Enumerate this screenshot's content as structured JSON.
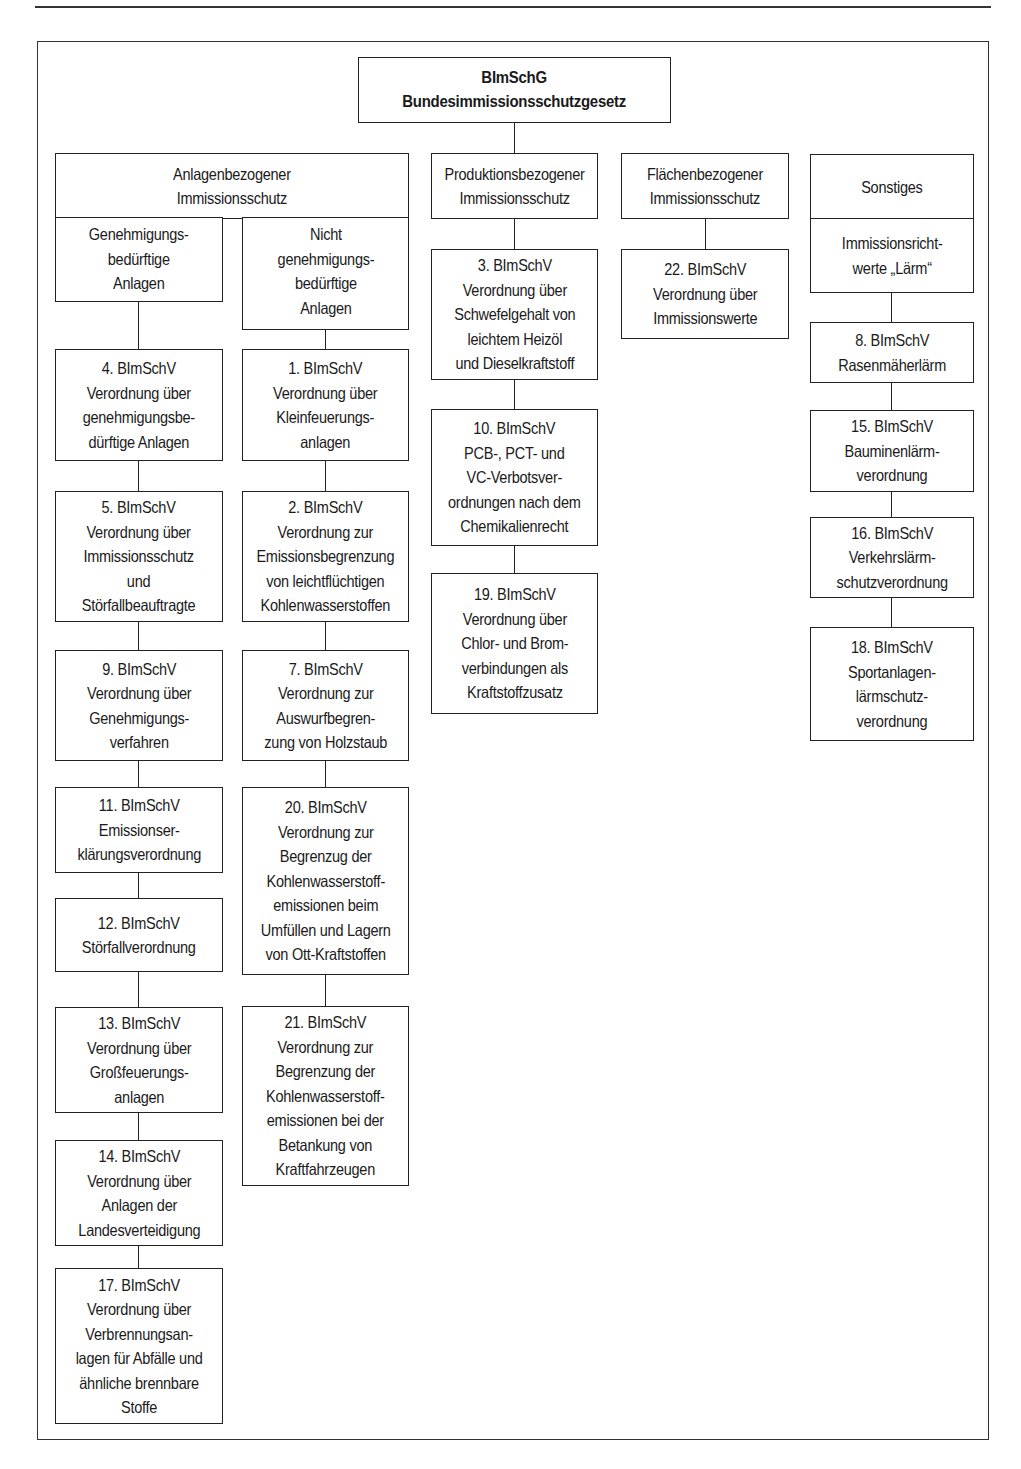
{
  "root": {
    "label": "BImSchG\nBundesimmissionsschutzgesetz"
  },
  "categories": {
    "anlagen": {
      "label": "Anlagenbezogener\nImmissionsschutz",
      "genehmigungsbeduerftig": {
        "label": "Genehmigungs-\nbedürftige\nAnlagen",
        "items": [
          "4. BImSchV\nVerordnung über\ngenehmigungsbe-\ndürftige Anlagen",
          "5. BImSchV\nVerordnung über\nImmissionsschutz\nund\nStörfallbeauftragte",
          "9. BImSchV\nVerordnung über\nGenehmigungs-\nverfahren",
          "11. BImSchV\nEmissionser-\nklärungsverordnung",
          "12. BImSchV\nStörfallverordnung",
          "13. BImSchV\nVerordnung über\nGroßfeuerungs-\nanlagen",
          "14. BImSchV\nVerordnung über\nAnlagen der\nLandesverteidigung",
          "17. BImSchV\nVerordnung über\nVerbrennungsan-\nlagen für Abfälle und\nähnliche brennbare\nStoffe"
        ]
      },
      "nicht_genehmigungsbeduerftig": {
        "label": "Nicht\ngenehmigungs-\nbedürftige\nAnlagen",
        "items": [
          "1. BImSchV\nVerordnung über\nKleinfeuerungs-\nanlagen",
          "2. BImSchV\nVerordnung zur\nEmissionsbegrenzung\nvon leichtflüchtigen\nKohlenwasserstoffen",
          "7. BImSchV\nVerordnung zur\nAuswurfbegren-\nzung von Holzstaub",
          "20. BImSchV\nVerordnung zur\nBegrenzug der\nKohlenwasserstoff-\nemissionen beim\nUmfüllen und Lagern\nvon Ott-Kraftstoffen",
          "21. BImSchV\nVerordnung zur\nBegrenzung der\nKohlenwasserstoff-\nemissionen bei der\nBetankung von\nKraftfahrzeugen"
        ]
      }
    },
    "produktion": {
      "label": "Produktionsbezogener\nImmissionsschutz",
      "items": [
        "3. BImSchV\nVerordnung über\nSchwefelgehalt von\nleichtem Heizöl\nund Dieselkraftstoff",
        "10. BImSchV\nPCB-, PCT- und\nVC-Verbotsver-\nordnungen nach dem\nChemikalienrecht",
        "19. BImSchV\nVerordnung über\nChlor- und Brom-\nverbindungen als\nKraftstoffzusatz"
      ]
    },
    "flaechen": {
      "label": "Flächenbezogener\nImmissionsschutz",
      "items": [
        "22. BImSchV\nVerordnung über\nImmissionswerte"
      ]
    },
    "sonstiges": {
      "label": "Sonstiges",
      "sub_label": "Immissionsricht-\nwerte „Lärm“",
      "items": [
        "8. BImSchV\nRasenmäherlärm",
        "15. BImSchV\nBauminenlärm-\nverordnung",
        "16. BImSchV\nVerkehrslärm-\nschutzverordnung",
        "18. BImSchV\nSportanlagen-\nlärmschutz-\nverordnung"
      ]
    }
  }
}
